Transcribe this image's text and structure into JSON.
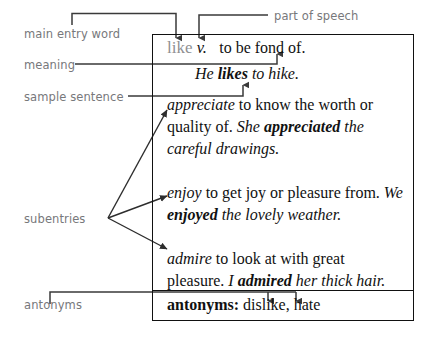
{
  "diagram": {
    "labels": {
      "main_entry_word": "main entry word",
      "part_of_speech": "part of speech",
      "meaning": "meaning",
      "sample_sentence": "sample sentence",
      "subentries": "subentries",
      "antonyms": "antonyms"
    },
    "label_color": "#77787b",
    "line_color": "#3a3a3a",
    "box_border_color": "#111111"
  },
  "entry": {
    "headword": "like",
    "headword_color": "#8f9092",
    "part_of_speech": "v.",
    "meaning_italic": "to",
    "meaning_rest": " be fond of.",
    "sample_sentence": {
      "pre": "He ",
      "bold": "likes",
      "post": " to hike."
    },
    "subentries": [
      {
        "term": "appreciate",
        "definition": " to know the worth or quality of. ",
        "example_pre": "She ",
        "example_bold": "appreciated",
        "example_post": " the careful drawings."
      },
      {
        "term": "enjoy",
        "definition": " to get joy or pleasure from. ",
        "example_pre": "We ",
        "example_bold": "enjoyed",
        "example_post": " the lovely weather."
      },
      {
        "term": "admire",
        "definition": " to look at with great pleasure. ",
        "example_pre": "I ",
        "example_bold": "admired",
        "example_post": " her thick hair."
      }
    ],
    "antonyms": {
      "label": "antonyms:",
      "values": " dislike, hate"
    }
  }
}
